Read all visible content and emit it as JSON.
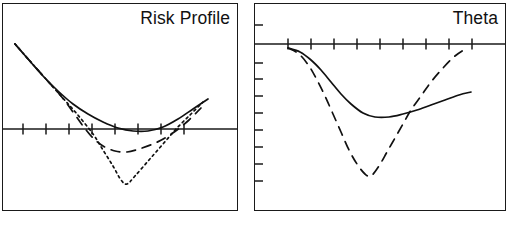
{
  "figure": {
    "width": 507,
    "height": 229,
    "background": "#ffffff",
    "ink_color": "#111111",
    "border_color": "#1a1a1a"
  },
  "panels": [
    {
      "name": "risk-profile",
      "title": "Risk Profile",
      "title_align": "right",
      "frame": {
        "x": 2,
        "y": 3,
        "width": 236,
        "height": 208
      },
      "zero_axis_y": 128,
      "x_axis_ticks": {
        "count": 8,
        "positions_x": [
          20,
          43,
          66,
          89,
          112,
          135,
          158,
          181
        ],
        "length": 11,
        "orientation": "vertical"
      },
      "y_axis_ticks": {
        "count": 0,
        "positions_y": []
      },
      "series": [
        {
          "name": "total-position",
          "style": "solid",
          "points": [
            [
              12,
              40
            ],
            [
              25,
              55
            ],
            [
              40,
              72
            ],
            [
              55,
              87
            ],
            [
              70,
              100
            ],
            [
              85,
              110
            ],
            [
              100,
              118
            ],
            [
              115,
              124
            ],
            [
              130,
              127
            ],
            [
              145,
              127
            ],
            [
              160,
              123
            ],
            [
              175,
              115
            ],
            [
              190,
              105
            ],
            [
              205,
              95
            ]
          ]
        },
        {
          "name": "expiration-payoff",
          "style": "dotted",
          "points": [
            [
              12,
              40
            ],
            [
              26,
              56
            ],
            [
              42,
              74
            ],
            [
              58,
              92
            ],
            [
              74,
              110
            ],
            [
              90,
              130
            ],
            [
              100,
              146
            ],
            [
              110,
              162
            ],
            [
              118,
              176
            ],
            [
              124,
              180
            ],
            [
              132,
              172
            ],
            [
              146,
              156
            ],
            [
              160,
              140
            ],
            [
              174,
              124
            ],
            [
              188,
              110
            ],
            [
              200,
              98
            ]
          ]
        },
        {
          "name": "intermediate-date",
          "style": "dashed",
          "points": [
            [
              12,
              40
            ],
            [
              26,
              56
            ],
            [
              42,
              74
            ],
            [
              58,
              92
            ],
            [
              70,
              108
            ],
            [
              80,
              122
            ],
            [
              90,
              134
            ],
            [
              100,
              142
            ],
            [
              112,
              147
            ],
            [
              124,
              148
            ],
            [
              136,
              145
            ],
            [
              150,
              140
            ],
            [
              162,
              134
            ],
            [
              174,
              126
            ],
            [
              186,
              116
            ],
            [
              198,
              104
            ]
          ]
        }
      ]
    },
    {
      "name": "theta",
      "title": "Theta",
      "title_align": "right",
      "frame": {
        "x": 254,
        "y": 3,
        "width": 252,
        "height": 208
      },
      "zero_axis_y": 43,
      "x_axis_ticks": {
        "count": 9,
        "positions_x": [
          33,
          56,
          79,
          102,
          125,
          148,
          171,
          194,
          217
        ],
        "length": 11,
        "orientation": "vertical"
      },
      "y_axis_ticks": {
        "count": 9,
        "positions_y": [
          24,
          62,
          78,
          95,
          112,
          129,
          146,
          163,
          180
        ],
        "length": 8,
        "orientation": "horizontal"
      },
      "series": [
        {
          "name": "theta-curve-solid",
          "style": "solid",
          "points": [
            [
              33,
              44
            ],
            [
              45,
              48
            ],
            [
              56,
              56
            ],
            [
              66,
              66
            ],
            [
              76,
              78
            ],
            [
              86,
              90
            ],
            [
              96,
              100
            ],
            [
              108,
              109
            ],
            [
              120,
              113
            ],
            [
              134,
              113
            ],
            [
              148,
              110
            ],
            [
              162,
              106
            ],
            [
              176,
              101
            ],
            [
              190,
              96
            ],
            [
              204,
              91
            ],
            [
              216,
              88
            ]
          ]
        },
        {
          "name": "theta-curve-dashed",
          "style": "dashed",
          "points": [
            [
              33,
              44
            ],
            [
              44,
              50
            ],
            [
              54,
              62
            ],
            [
              62,
              76
            ],
            [
              70,
              92
            ],
            [
              78,
              110
            ],
            [
              86,
              128
            ],
            [
              94,
              146
            ],
            [
              102,
              160
            ],
            [
              110,
              170
            ],
            [
              116,
              172
            ],
            [
              124,
              162
            ],
            [
              132,
              148
            ],
            [
              140,
              134
            ],
            [
              148,
              120
            ],
            [
              156,
              106
            ],
            [
              166,
              92
            ],
            [
              176,
              78
            ],
            [
              188,
              64
            ],
            [
              200,
              52
            ],
            [
              212,
              44
            ]
          ]
        }
      ]
    }
  ]
}
